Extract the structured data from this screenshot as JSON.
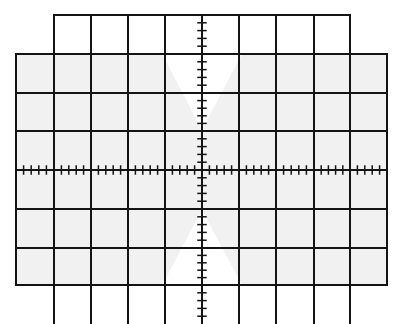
{
  "diagram": {
    "type": "oscilloscope-graticule",
    "background": "#ffffff",
    "shade": "#f1f1f1",
    "line_color": "#141414",
    "line_width": 2,
    "columns_x": [
      16,
      54,
      91,
      128,
      165,
      202,
      239,
      276,
      314,
      350,
      387
    ],
    "rows_y": [
      15,
      54,
      93,
      131,
      170,
      209,
      248,
      285
    ],
    "bottom_y": 324,
    "center": {
      "x": 202,
      "y": 170
    },
    "outer_top": {
      "x1": 54,
      "x2": 350,
      "y1": 15,
      "y2": 54
    },
    "outer_mid": {
      "x1": 16,
      "x2": 387,
      "y1": 54,
      "y2": 285
    },
    "outer_bottom": {
      "x1": 54,
      "x2": 350,
      "y1": 285,
      "y2": 324
    },
    "minor_ticks_per_division": 5,
    "tick_half_length": 4
  }
}
